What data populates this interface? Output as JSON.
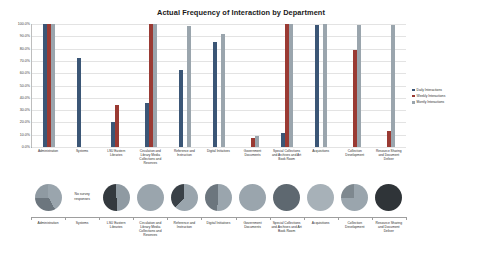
{
  "chart_data": [
    {
      "type": "bar",
      "title": "Actual Frequency of Interaction by Department",
      "xlabel": "",
      "ylabel": "",
      "ylim": [
        0,
        100
      ],
      "ytick_labels": [
        "100.0%",
        "90.0%",
        "80.0%",
        "70.0%",
        "60.0%",
        "50.0%",
        "40.0%",
        "30.0%",
        "20.0%",
        "10.0%",
        "0.0%"
      ],
      "grid": true,
      "legend_position": "right",
      "categories": [
        "Administration",
        "Systems",
        "LSU Eastern Libraries",
        "Circulation and Library Media Collections and Reserves",
        "Reference and Instruction",
        "Digital Initiatives",
        "Government Documents",
        "Special Collections and Archives and Art Book Room",
        "Acquisitions",
        "Collection Development",
        "Resource Sharing and Document Deliver"
      ],
      "series": [
        {
          "name": "Daily Interactions",
          "color": "#3b5676",
          "values": [
            100,
            72,
            20,
            36,
            63,
            85,
            0,
            11,
            99,
            0,
            0
          ]
        },
        {
          "name": "Weekly Interactions",
          "color": "#9a3a33",
          "values": [
            100,
            0,
            34,
            100,
            0,
            0,
            7,
            100,
            0,
            79,
            13
          ]
        },
        {
          "name": "Montly Interactions",
          "color": "#9aa5ad",
          "values": [
            100,
            0,
            0,
            100,
            98,
            92,
            9,
            100,
            100,
            99,
            99
          ]
        }
      ]
    },
    {
      "type": "pie",
      "title": "",
      "legend_position": "right",
      "legend_entries": [
        "Daily Interactions",
        "Weekly Interactions",
        "Monthly Interactions",
        "Unanswered Interactions"
      ],
      "categories": [
        "Administration",
        "Systems",
        "LSU Eastern Libraries",
        "Circulation and Library Media Collections and Reserves",
        "Reference and Instruction",
        "Digital Initiatives",
        "Government Documents",
        "Special Collections and Archives and Art Book Room",
        "Acquisitions",
        "Collection Development",
        "Resource Sharing and Document Deliver"
      ],
      "annotations": [
        {
          "category": "Systems",
          "text": "No survey responses"
        }
      ],
      "pies": [
        {
          "category": "Administration",
          "slices": [
            {
              "label": "Daily Interactions",
              "value": 42,
              "color": "#9aa5ad"
            },
            {
              "label": "Weekly Interactions",
              "value": 33,
              "color": "#6c767e"
            },
            {
              "label": "Monthly Interactions",
              "value": 25,
              "color": "#8f9aa2"
            }
          ]
        },
        {
          "category": "Systems",
          "slices": []
        },
        {
          "category": "LSU Eastern Libraries",
          "slices": [
            {
              "label": "Daily Interactions",
              "value": 50,
              "color": "#8f9aa2"
            },
            {
              "label": "Weekly Interactions",
              "value": 50,
              "color": "#33393e"
            }
          ]
        },
        {
          "category": "Circulation and Library Media Collections and Reserves",
          "slices": [
            {
              "label": "Daily Interactions",
              "value": 100,
              "color": "#9aa5ad"
            }
          ]
        },
        {
          "category": "Reference and Instruction",
          "slices": [
            {
              "label": "Daily Interactions",
              "value": 62,
              "color": "#9aa5ad"
            },
            {
              "label": "Weekly Interactions",
              "value": 38,
              "color": "#3a4147"
            }
          ]
        },
        {
          "category": "Digital Initiatives",
          "slices": [
            {
              "label": "Daily Interactions",
              "value": 52,
              "color": "#9aa5ad"
            },
            {
              "label": "Weekly Interactions",
              "value": 48,
              "color": "#6c767e"
            }
          ]
        },
        {
          "category": "Government Documents",
          "slices": [
            {
              "label": "Daily Interactions",
              "value": 100,
              "color": "#9aa5ad"
            }
          ]
        },
        {
          "category": "Special Collections and Archives and Art Book Room",
          "slices": [
            {
              "label": "Daily Interactions",
              "value": 100,
              "color": "#5e6870"
            }
          ]
        },
        {
          "category": "Acquisitions",
          "slices": [
            {
              "label": "Daily Interactions",
              "value": 100,
              "color": "#a7b1b8"
            }
          ]
        },
        {
          "category": "Collection Development",
          "slices": [
            {
              "label": "Daily Interactions",
              "value": 75,
              "color": "#9aa5ad"
            },
            {
              "label": "Weekly Interactions",
              "value": 25,
              "color": "#7e888f"
            }
          ]
        },
        {
          "category": "Resource Sharing and Document Deliver",
          "slices": [
            {
              "label": "Daily Interactions",
              "value": 100,
              "color": "#2f3438"
            }
          ]
        }
      ]
    }
  ],
  "bar_chart": {
    "title": "Actual Frequency of Interaction by Department"
  },
  "pie_chart": {
    "no_survey_note": "No survey responses"
  }
}
